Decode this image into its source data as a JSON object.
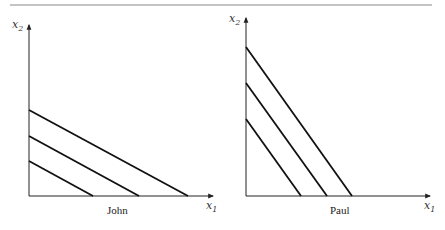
{
  "figure": {
    "top_rule_color": "#8a8a8a",
    "line_color": "#111111",
    "axis_color": "#222222"
  },
  "panels": [
    {
      "name": "John",
      "label": "John",
      "x_axis": {
        "var": "x",
        "sub": "1"
      },
      "y_axis": {
        "var": "x",
        "sub": "2"
      },
      "budget_lines": [
        {
          "y_intercept_px": 161,
          "x_intercept_px": 93
        },
        {
          "y_intercept_px": 136,
          "x_intercept_px": 139
        },
        {
          "y_intercept_px": 110,
          "x_intercept_px": 188
        }
      ]
    },
    {
      "name": "Paul",
      "label": "Paul",
      "x_axis": {
        "var": "x",
        "sub": "1"
      },
      "y_axis": {
        "var": "x",
        "sub": "2"
      },
      "budget_lines": [
        {
          "y_intercept_px": 119,
          "x_intercept_px": 301
        },
        {
          "y_intercept_px": 83,
          "x_intercept_px": 327
        },
        {
          "y_intercept_px": 47,
          "x_intercept_px": 352
        }
      ]
    }
  ]
}
